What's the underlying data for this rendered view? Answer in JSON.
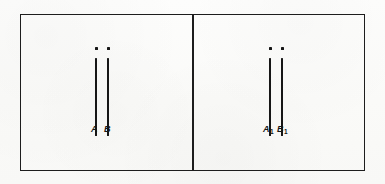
{
  "figure": {
    "kind": "line-diagram",
    "background_color": "#fcfcfb",
    "ink_color": "#161616",
    "frame_color": "#1d1d1d"
  },
  "panels": [
    {
      "id": "left",
      "name": "panel-left",
      "dots": [
        {
          "name": "dot-a",
          "label": ""
        },
        {
          "name": "dot-b",
          "label": ""
        }
      ],
      "strokes": [
        {
          "name": "stroke-a"
        },
        {
          "name": "stroke-b"
        }
      ],
      "labels": [
        {
          "name": "label-a",
          "text": "A",
          "sub": ""
        },
        {
          "name": "label-b",
          "text": "B",
          "sub": ""
        }
      ]
    },
    {
      "id": "right",
      "name": "panel-right",
      "dots": [
        {
          "name": "dot-a1",
          "label": ""
        },
        {
          "name": "dot-b1",
          "label": ""
        }
      ],
      "strokes": [
        {
          "name": "stroke-a1"
        },
        {
          "name": "stroke-b1"
        }
      ],
      "labels": [
        {
          "name": "label-a1",
          "text": "A",
          "sub": "1"
        },
        {
          "name": "label-b1",
          "text": "B",
          "sub": "1"
        }
      ]
    }
  ],
  "text": {
    "label_a": "A",
    "label_b": "B",
    "label_a1_base": "A",
    "label_a1_sub": "1",
    "label_b1_base": "B",
    "label_b1_sub": "1"
  }
}
